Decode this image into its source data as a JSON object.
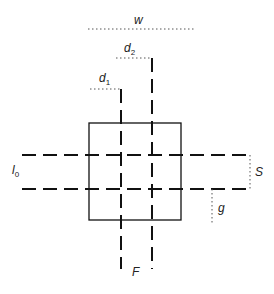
{
  "diagram": {
    "type": "geometry-schematic",
    "labels": {
      "w": "w",
      "d2": "d",
      "d2_sub": "2",
      "d1": "d",
      "d1_sub": "1",
      "l0": "l",
      "l0_sub": "0",
      "S": "S",
      "g": "g",
      "F": "F"
    },
    "colors": {
      "line": "#111111",
      "dotted": "#555555",
      "background": "#ffffff"
    }
  }
}
